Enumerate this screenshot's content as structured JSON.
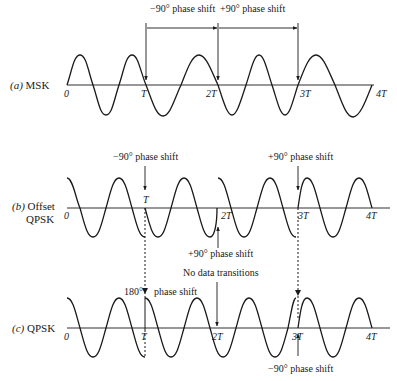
{
  "panels": [
    {
      "id": "a",
      "label_letter": "(a)",
      "label_name": "MSK",
      "ticks": [
        "0",
        "T",
        "2T",
        "3T",
        "4T"
      ],
      "annotations": {
        "top_left": "−90° phase shift",
        "top_right": "+90° phase shift"
      }
    },
    {
      "id": "b",
      "label_letter": "(b)",
      "label_name_line1": "Offset",
      "label_name_line2": "QPSK",
      "ticks": [
        "0",
        "T",
        "2T",
        "3T",
        "4T"
      ],
      "annotations": {
        "at_T": "−90° phase shift",
        "at_3T": "+90° phase shift",
        "at_2T_below": "+90° phase shift"
      }
    },
    {
      "id": "c",
      "label_letter": "(c)",
      "label_name": "QPSK",
      "ticks": [
        "0",
        "T",
        "2T",
        "3T",
        "4T"
      ],
      "annotations": {
        "at_T_left": "180°",
        "at_T_right": "phase shift",
        "at_2T": "No data transitions",
        "at_3T_below": "−90° phase shift"
      }
    }
  ]
}
